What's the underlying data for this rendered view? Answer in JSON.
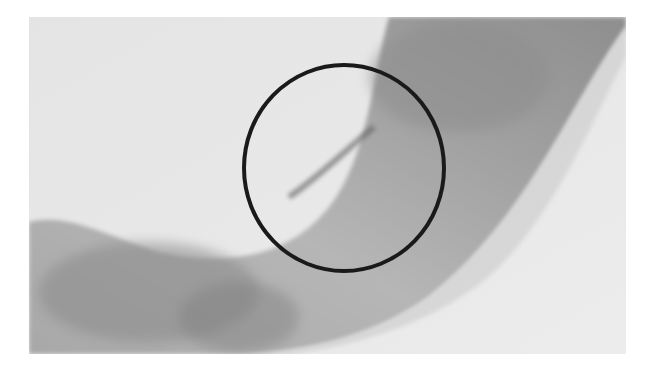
{
  "image": {
    "kind": "grayscale photograph",
    "subject": "curved translucent band",
    "background_color": "#e9e9e9",
    "band_color_light": "#c9c9c9",
    "band_color_dark": "#8f8f8f"
  },
  "annotation": {
    "shape": "circle",
    "stroke_color": "#1a1a1a",
    "stroke_width": 4,
    "center_x": 344,
    "center_y": 168,
    "radius_x": 100,
    "radius_y": 103
  }
}
